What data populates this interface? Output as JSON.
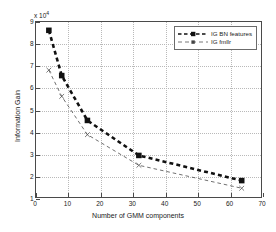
{
  "chart_data": {
    "type": "line",
    "title": "",
    "xlabel": "Number of GMM components",
    "ylabel": "Information Gain",
    "y_multiplier": "x 10",
    "y_exponent": "4",
    "xlim": [
      0,
      70
    ],
    "ylim": [
      1,
      9
    ],
    "xticks": [
      0,
      10,
      20,
      30,
      40,
      50,
      60,
      70
    ],
    "yticks": [
      1,
      2,
      3,
      4,
      5,
      6,
      7,
      8,
      9
    ],
    "grid": true,
    "legend_position": "top-right",
    "x": [
      4,
      8,
      16,
      32,
      64
    ],
    "series": [
      {
        "name": "IG BN features",
        "values": [
          8.62,
          6.55,
          4.5,
          2.9,
          1.75
        ],
        "color": "#111111",
        "marker": "square",
        "style": "thick-dashed"
      },
      {
        "name": "IG fmllr",
        "values": [
          6.8,
          5.6,
          3.85,
          2.45,
          1.4
        ],
        "color": "#555555",
        "marker": "x",
        "style": "thin-dashed"
      }
    ]
  },
  "axes": {
    "x_tick_labels": [
      "0",
      "10",
      "20",
      "30",
      "40",
      "50",
      "60",
      "70"
    ],
    "y_tick_labels": [
      "1",
      "2",
      "3",
      "4",
      "5",
      "6",
      "7",
      "8",
      "9"
    ],
    "x_title": "Number of GMM components",
    "y_title": "Information Gain",
    "exponent_label": "x 10"
  },
  "legend": {
    "items": [
      {
        "label": "IG BN features"
      },
      {
        "label": "IG fmllr"
      }
    ]
  }
}
